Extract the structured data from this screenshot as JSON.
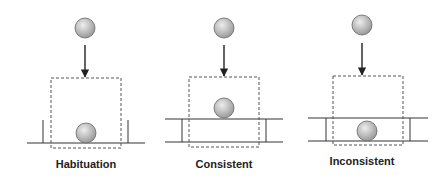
{
  "figure": {
    "colors": {
      "line": "#333333",
      "dashed_box": "#555555",
      "ball_fill_light": "#e6e6e6",
      "ball_fill_dark": "#9a9a9a",
      "ball_stroke": "#666666",
      "label": "#222222"
    },
    "panels": [
      {
        "id": "habituation",
        "label": "Habituation",
        "top_ball": {
          "cx": 85,
          "cy": 28,
          "r": 10
        },
        "arrow": {
          "x": 85,
          "y1": 45,
          "y2": 77
        },
        "screen_box": {
          "x": 51,
          "y": 78,
          "w": 70,
          "h": 70
        },
        "ground": {
          "y": 143,
          "x1": 27,
          "x2": 145
        },
        "posts": [
          {
            "x": 43,
            "y1": 120,
            "y2": 143
          },
          {
            "x": 128,
            "y1": 120,
            "y2": 143
          }
        ],
        "board_top": null,
        "result_ball": {
          "cx": 86,
          "cy": 133,
          "r": 10
        },
        "label_pos": {
          "x": 86,
          "y": 168
        }
      },
      {
        "id": "consistent",
        "label": "Consistent",
        "top_ball": {
          "cx": 224,
          "cy": 28,
          "r": 10
        },
        "arrow": {
          "x": 224,
          "y1": 45,
          "y2": 76
        },
        "screen_box": {
          "x": 189,
          "y": 77,
          "w": 70,
          "h": 70
        },
        "ground": {
          "y": 142,
          "x1": 165,
          "x2": 283
        },
        "posts": [
          {
            "x": 182,
            "y1": 119,
            "y2": 142
          },
          {
            "x": 266,
            "y1": 119,
            "y2": 142
          }
        ],
        "board_top": {
          "y": 119,
          "x1": 165,
          "x2": 283
        },
        "result_ball": {
          "cx": 224,
          "cy": 108,
          "r": 10
        },
        "label_pos": {
          "x": 224,
          "y": 168
        }
      },
      {
        "id": "inconsistent",
        "label": "Inconsistent",
        "top_ball": {
          "cx": 362,
          "cy": 25,
          "r": 10
        },
        "arrow": {
          "x": 362,
          "y1": 43,
          "y2": 75
        },
        "screen_box": {
          "x": 333,
          "y": 76,
          "w": 70,
          "h": 69
        },
        "ground": {
          "y": 141,
          "x1": 308,
          "x2": 428
        },
        "posts": [
          {
            "x": 326,
            "y1": 118,
            "y2": 141
          },
          {
            "x": 410,
            "y1": 118,
            "y2": 141
          }
        ],
        "board_top": {
          "y": 118,
          "x1": 308,
          "x2": 428
        },
        "result_ball": {
          "cx": 367,
          "cy": 131,
          "r": 10
        },
        "label_pos": {
          "x": 362,
          "y": 165
        }
      }
    ]
  }
}
